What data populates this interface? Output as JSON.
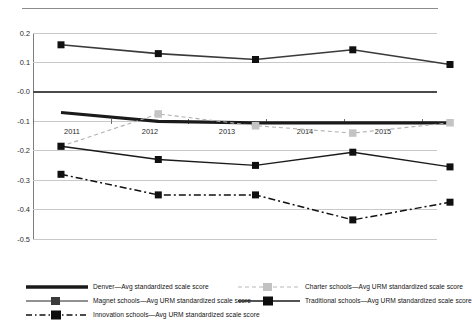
{
  "top_caption": "",
  "chart_data": {
    "type": "line",
    "title": "",
    "subtitle": "",
    "xlabel": "",
    "ylabel": "",
    "categories": [
      2011,
      2012,
      2013,
      2014,
      2015
    ],
    "x_tick_labels": [
      "2011",
      "2012",
      "2013",
      "2014",
      "2015"
    ],
    "y_tick_labels": [
      "0.2",
      "0.1",
      "-0.0",
      "-0.1",
      "-0.2",
      "-0.3",
      "-0.4",
      "-0.5"
    ],
    "y_ticks": [
      0.2,
      0.1,
      0.0,
      -0.1,
      -0.2,
      -0.3,
      -0.4,
      -0.5
    ],
    "ylim": [
      -0.5,
      0.2
    ],
    "grid": "horizontal",
    "legend_position": "bottom",
    "series": [
      {
        "name": "Denver—Avg standardized scale score",
        "short": "Denver",
        "values": [
          -0.07,
          -0.1,
          -0.105,
          -0.105,
          -0.105
        ],
        "color": "#1a1a1a",
        "style": "solid",
        "marker": "none",
        "width": 3.2
      },
      {
        "name": "Charter schools—Avg URM standardized scale score",
        "short": "Charter schools",
        "values": [
          -0.185,
          -0.075,
          -0.115,
          -0.14,
          -0.105
        ],
        "color": "#b0b0b0",
        "style": "dashed",
        "marker": "square",
        "width": 1.1
      },
      {
        "name": "Magnet schools—Avg URM standardized scale score",
        "short": "Magnet schools",
        "values": [
          -0.185,
          -0.23,
          -0.25,
          -0.205,
          -0.255
        ],
        "color": "#1a1a1a",
        "style": "solid",
        "marker": "square",
        "width": 1.4
      },
      {
        "name": "Traditional schools—Avg URM standardized scale score",
        "short": "Traditional schools",
        "values": [
          0.16,
          0.13,
          0.11,
          0.143,
          0.093
        ],
        "color": "#3a3a3a",
        "style": "solid",
        "marker": "square",
        "width": 1.6
      },
      {
        "name": "Innovation schools—Avg URM standardized scale score",
        "short": "Innovation schools",
        "values": [
          -0.28,
          -0.35,
          -0.35,
          -0.435,
          -0.375
        ],
        "color": "#111111",
        "style": "dashdot",
        "marker": "square",
        "width": 1.5
      }
    ]
  },
  "legend": {
    "items": [
      {
        "label": "Denver—Avg standardized scale score",
        "style": "solid-thick",
        "marker": "none",
        "color": "#1a1a1a"
      },
      {
        "label": "Charter schools—Avg URM standardized scale score",
        "style": "dashed",
        "marker": "square",
        "color": "#b0b0b0"
      },
      {
        "label": "Magnet schools—Avg URM standardized scale score",
        "style": "solid",
        "marker": "square",
        "color": "#555555"
      },
      {
        "label": "Traditional schools—Avg URM standardized scale score",
        "style": "solid",
        "marker": "square",
        "color": "#1a1a1a"
      },
      {
        "label": "Innovation schools—Avg URM standardized scale score",
        "style": "dashdot",
        "marker": "square",
        "color": "#111111"
      }
    ]
  }
}
